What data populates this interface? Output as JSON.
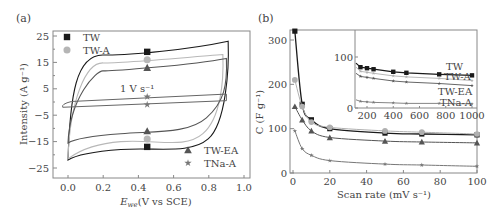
{
  "panels": {
    "a": {
      "label": "(a)"
    },
    "b": {
      "label": "(b)"
    }
  },
  "chart_data": [
    {
      "type": "line",
      "panel": "(a)",
      "title": "",
      "xlabel": "E_we (V vs SCE)",
      "xlabel_main": "E",
      "xlabel_sub": "we",
      "xlabel_rest": "(V vs SCE)",
      "ylabel": "Intensity (A g⁻¹)",
      "xlim": [
        -0.1,
        1.0
      ],
      "ylim": [
        -28,
        27
      ],
      "xticks": [
        "0.0",
        "0.2",
        "0.4",
        "0.6",
        "0.8",
        "1.0"
      ],
      "yticks": [
        "25",
        "15",
        "5",
        "−5",
        "−15",
        "−25"
      ],
      "annotation": "1 V s⁻¹",
      "legend": [
        {
          "name": "TW",
          "marker": "square",
          "color": "#1a1a1a"
        },
        {
          "name": "TW-A",
          "marker": "circle",
          "color": "#b5b5b5"
        },
        {
          "name": "TW-EA",
          "marker": "triangle",
          "color": "#555555"
        },
        {
          "name": "TNa-A",
          "marker": "star",
          "color": "#777777"
        }
      ],
      "series": [
        {
          "name": "TW",
          "marker_x": 0.45,
          "upper_at_marker": 19,
          "lower_at_marker": -17,
          "upper_end": 23,
          "lower_start": -22,
          "vmax": 0.9
        },
        {
          "name": "TW-A",
          "marker_x": 0.45,
          "upper_at_marker": 16,
          "lower_at_marker": -14,
          "upper_end": 18,
          "lower_start": -21.5,
          "vmax": 0.87
        },
        {
          "name": "TW-EA",
          "marker_x": 0.45,
          "upper_at_marker": 13,
          "lower_at_marker": -11,
          "upper_end": 16,
          "lower_start": -15.5,
          "vmax": 0.88
        },
        {
          "name": "TNa-A",
          "marker_x": 0.45,
          "upper_at_marker": 2,
          "lower_at_marker": -1,
          "upper_end": 3,
          "lower_start": -2,
          "vmax": 0.9
        }
      ]
    },
    {
      "type": "line",
      "panel": "(b)",
      "title": "",
      "xlabel": "Scan rate (mV s⁻¹)",
      "ylabel": "C (F g⁻¹)",
      "xlim": [
        -2,
        100
      ],
      "ylim": [
        0,
        320
      ],
      "xticks": [
        "0",
        "20",
        "40",
        "60",
        "80",
        "100"
      ],
      "yticks": [
        "0",
        "100",
        "200",
        "300"
      ],
      "x": [
        1,
        5,
        10,
        20,
        50,
        70,
        100
      ],
      "series": [
        {
          "name": "TW",
          "marker": "square",
          "values": [
            320,
            155,
            120,
            100,
            90,
            88,
            86
          ]
        },
        {
          "name": "TW-A",
          "marker": "circle",
          "values": [
            210,
            150,
            115,
            103,
            95,
            92,
            88
          ]
        },
        {
          "name": "TW-EA",
          "marker": "triangle",
          "values": [
            150,
            120,
            95,
            80,
            72,
            70,
            68
          ]
        },
        {
          "name": "TNa-A",
          "marker": "star",
          "values": [
            95,
            55,
            40,
            28,
            20,
            18,
            15
          ]
        }
      ],
      "inset": {
        "xlim": [
          100,
          1000
        ],
        "ylim": [
          0,
          150
        ],
        "xticks": [
          "200",
          "400",
          "600",
          "800",
          "1000"
        ],
        "yticks": [
          "0",
          "100"
        ],
        "x": [
          100,
          150,
          200,
          250,
          400,
          500,
          750,
          1000
        ],
        "labels": [
          "TW",
          "TW-A",
          "TW-EA",
          "TNa-A"
        ],
        "series": [
          {
            "name": "TW",
            "values": [
              88,
              80,
              78,
              76,
              71,
              69,
              66,
              64
            ]
          },
          {
            "name": "TW-A",
            "values": [
              80,
              72,
              70,
              68,
              63,
              61,
              58,
              54
            ]
          },
          {
            "name": "TW-EA",
            "values": [
              68,
              62,
              60,
              58,
              53,
              51,
              48,
              44
            ]
          },
          {
            "name": "TNa-A",
            "values": [
              16,
              13,
              12,
              11,
              10,
              9,
              9,
              8
            ]
          }
        ]
      }
    }
  ]
}
